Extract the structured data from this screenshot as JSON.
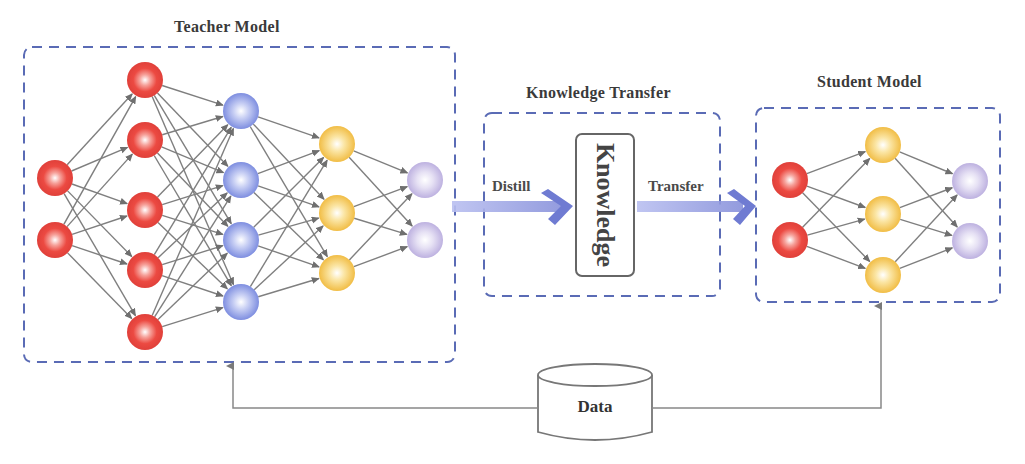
{
  "titles": {
    "teacher": "Teacher Model",
    "transfer": "Knowledge Transfer",
    "student": "Student Model"
  },
  "arrows": {
    "distill": "Distill",
    "transfer": "Transfer"
  },
  "knowledge_box": {
    "label": "Knowledge"
  },
  "data_store": {
    "label": "Data"
  },
  "colors": {
    "dash_border": "#5a6bb5",
    "edge": "#7f7f7f",
    "red_node": "#e8413b",
    "blue_node": "#7f8fe0",
    "yellow_node": "#f3c24a",
    "purple_node": "#c1b6e2",
    "flow_arrow": "#7f88d6"
  },
  "teacher_network": {
    "layers": [
      {
        "name": "input",
        "color": "red",
        "x": 55,
        "ys": [
          178,
          240
        ]
      },
      {
        "name": "hidden1",
        "color": "red",
        "x": 145,
        "ys": [
          80,
          140,
          210,
          270,
          332
        ]
      },
      {
        "name": "hidden2",
        "color": "blue",
        "x": 241,
        "ys": [
          111,
          180,
          240,
          302
        ]
      },
      {
        "name": "hidden3",
        "color": "yellow",
        "x": 337,
        "ys": [
          144,
          213,
          273
        ]
      },
      {
        "name": "output",
        "color": "purple",
        "x": 425,
        "ys": [
          180,
          240
        ]
      }
    ]
  },
  "student_network": {
    "layers": [
      {
        "name": "input",
        "color": "red",
        "x": 790,
        "ys": [
          180,
          240
        ]
      },
      {
        "name": "hidden",
        "color": "yellow",
        "x": 883,
        "ys": [
          145,
          214,
          275
        ]
      },
      {
        "name": "output",
        "color": "purple",
        "x": 970,
        "ys": [
          181,
          241
        ]
      }
    ]
  }
}
